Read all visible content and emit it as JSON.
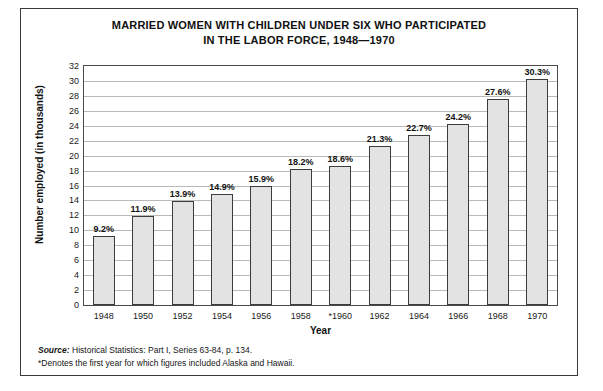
{
  "chart_data": {
    "type": "bar",
    "title": "MARRIED WOMEN WITH CHILDREN UNDER SIX WHO PARTICIPATED IN THE LABOR FORCE, 1948—1970",
    "title_line1": "MARRIED WOMEN WITH CHILDREN UNDER SIX WHO PARTICIPATED",
    "title_line2": "IN THE LABOR FORCE, 1948—1970",
    "xlabel": "Year",
    "ylabel": "Number employed (in thousands)",
    "categories": [
      "1948",
      "1950",
      "1952",
      "1954",
      "1956",
      "1958",
      "*1960",
      "1962",
      "1964",
      "1966",
      "1968",
      "1970"
    ],
    "values": [
      9.2,
      11.9,
      13.9,
      14.9,
      15.9,
      18.2,
      18.6,
      21.3,
      22.7,
      24.2,
      27.6,
      30.3
    ],
    "data_labels": [
      "9.2%",
      "11.9%",
      "13.9%",
      "14.9%",
      "15.9%",
      "18.2%",
      "18.6%",
      "21.3%",
      "22.7%",
      "24.2%",
      "27.6%",
      "30.3%"
    ],
    "ylim": [
      0,
      32
    ],
    "yticks": [
      32,
      30,
      28,
      26,
      24,
      22,
      20,
      18,
      16,
      14,
      12,
      10,
      8,
      6,
      4,
      2,
      0
    ],
    "grid": true,
    "legend": null,
    "bar_color": "#e3e3e3",
    "bar_border_color": "#3c3c3c",
    "grid_color": "#b9b9b9"
  },
  "notes": {
    "source_label": "Source:",
    "source_text": " Historical Statistics: Part I, Series 63-84, p. 134.",
    "footnote": "*Denotes the first year for which figures included Alaska and Hawaii."
  }
}
